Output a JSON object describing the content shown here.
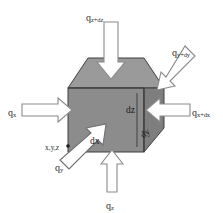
{
  "figure": {
    "type": "diagram",
    "background_color": "#ffffff"
  },
  "cube": {
    "name": "differential-control-volume",
    "front_face_color": "#8c8c8c",
    "top_face_color": "#9a9a9a",
    "right_face_color": "#7e7e7e",
    "edge_color": "#3a3a3a"
  },
  "arrows": {
    "outline_color": "#6e6e6e",
    "fill_color": "#ffffff",
    "items": [
      {
        "name": "heat-flux-arrow-z-plus-dz",
        "direction": "down",
        "face": "top"
      },
      {
        "name": "heat-flux-arrow-y-plus-dy",
        "direction": "down-left",
        "face": "right"
      },
      {
        "name": "heat-flux-arrow-x",
        "direction": "right",
        "face": "left"
      },
      {
        "name": "heat-flux-arrow-x-plus-dx",
        "direction": "left",
        "face": "right"
      },
      {
        "name": "heat-flux-arrow-y",
        "direction": "up-right",
        "face": "front"
      },
      {
        "name": "heat-flux-arrow-z",
        "direction": "up",
        "face": "bottom"
      }
    ]
  },
  "labels": {
    "q_z_plus_dz": {
      "base": "q",
      "sub": "z+dz"
    },
    "q_y_plus_dy": {
      "base": "q",
      "sub": "y+dy"
    },
    "q_x": {
      "base": "q",
      "sub": "x"
    },
    "q_x_plus_dx": {
      "base": "q",
      "sub": "x+dx"
    },
    "q_y": {
      "base": "q",
      "sub": "y"
    },
    "q_z": {
      "base": "q",
      "sub": "z"
    }
  },
  "dimensions": {
    "dz": "dz",
    "dy": "dy",
    "dx": "dx"
  },
  "coordinates": {
    "origin_label": "x,y,z"
  }
}
